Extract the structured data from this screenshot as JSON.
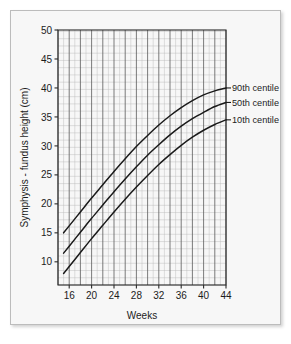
{
  "figure": {
    "frame_border_color": "#bcbcbc",
    "background_color": "#f7f7f7",
    "curve_color": "#1a1a1a",
    "grid_minor_color": "#b9b9b9",
    "grid_major_color": "#5a5a5a"
  },
  "chart_data": {
    "type": "line",
    "title": "",
    "xlabel": "Weeks",
    "ylabel": "Symphysis - fundus height (cm)",
    "xlim": [
      14,
      44
    ],
    "ylim": [
      6,
      50
    ],
    "xticks": [
      16,
      20,
      24,
      28,
      32,
      36,
      40,
      44
    ],
    "xtick_labels": [
      "16",
      "20",
      "24",
      "28",
      "32",
      "36",
      "40",
      "44"
    ],
    "yticks": [
      10,
      15,
      20,
      25,
      30,
      35,
      40,
      45,
      50
    ],
    "ytick_labels": [
      "10",
      "15",
      "20",
      "25",
      "30",
      "35",
      "40",
      "45",
      "50"
    ],
    "grid": true,
    "grid_minor_step_x": 1,
    "grid_major_step_x": 2,
    "grid_minor_step_y": 1.25,
    "grid_major_step_y": 2.5,
    "legend_position": "right-inline-labels",
    "x": [
      15,
      16,
      18,
      20,
      22,
      24,
      26,
      28,
      30,
      32,
      34,
      36,
      38,
      40,
      42,
      44
    ],
    "series": [
      {
        "name": "90th centile",
        "label": "90th centile",
        "values": [
          15.0,
          16.2,
          18.6,
          21.0,
          23.3,
          25.6,
          27.8,
          29.9,
          31.8,
          33.6,
          35.2,
          36.6,
          37.8,
          38.8,
          39.5,
          40.0
        ]
      },
      {
        "name": "50th centile",
        "label": "50th centile",
        "values": [
          11.5,
          12.7,
          15.1,
          17.5,
          19.8,
          22.1,
          24.3,
          26.4,
          28.4,
          30.2,
          31.9,
          33.4,
          34.7,
          35.8,
          36.8,
          37.5
        ]
      },
      {
        "name": "10th centile",
        "label": "10th centile",
        "values": [
          8.0,
          9.2,
          11.6,
          14.0,
          16.3,
          18.6,
          20.8,
          22.9,
          24.9,
          26.8,
          28.5,
          30.1,
          31.5,
          32.7,
          33.7,
          34.5
        ]
      }
    ]
  }
}
